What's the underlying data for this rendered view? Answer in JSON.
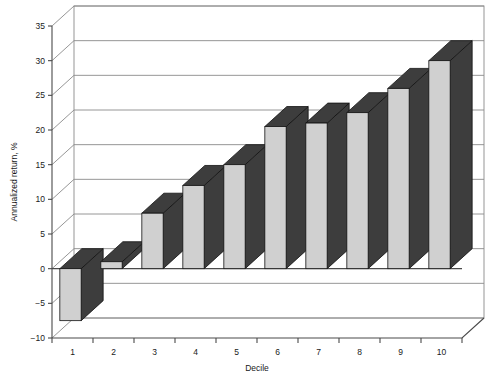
{
  "chart_data": {
    "type": "bar",
    "title": "",
    "subtitle": "",
    "xlabel": "Decile",
    "ylabel": "Annualized return, %",
    "categories": [
      "1",
      "2",
      "3",
      "4",
      "5",
      "6",
      "7",
      "8",
      "9",
      "10"
    ],
    "values": [
      -7.5,
      1.0,
      8.0,
      12.0,
      15.0,
      20.5,
      21.0,
      22.5,
      26.0,
      30.0
    ],
    "series": [
      {
        "name": "Annualized return",
        "values": [
          -7.5,
          1.0,
          8.0,
          12.0,
          15.0,
          20.5,
          21.0,
          22.5,
          26.0,
          30.0
        ]
      }
    ],
    "ylim": [
      -10,
      35
    ],
    "ytick_labels": [
      "35",
      "30",
      "25",
      "20",
      "15",
      "10",
      "5",
      "0",
      "-5",
      "-10"
    ],
    "ytick_values": [
      35,
      30,
      25,
      20,
      15,
      10,
      5,
      0,
      -5,
      -10
    ],
    "xtick_labels": [
      "1",
      "2",
      "3",
      "4",
      "5",
      "6",
      "7",
      "8",
      "9",
      "10"
    ],
    "grid": true,
    "legend": "none",
    "style": "3d-column",
    "colors": {
      "bar_front": "#d0d0d0",
      "bar_side": "#3d3d3d",
      "bar_top": "#3d3d3d",
      "bar_outline": "#111111",
      "axis": "#4a4a4a",
      "gridline": "#8a8a8a",
      "text": "#1a1a1a",
      "background": "#ffffff"
    }
  },
  "axes": {
    "y": {
      "title": "Annualized return, %",
      "ticks": [
        {
          "label": "35",
          "value": 35
        },
        {
          "label": "30",
          "value": 30
        },
        {
          "label": "25",
          "value": 25
        },
        {
          "label": "20",
          "value": 20
        },
        {
          "label": "15",
          "value": 15
        },
        {
          "label": "10",
          "value": 10
        },
        {
          "label": "5",
          "value": 5
        },
        {
          "label": "0",
          "value": 0
        },
        {
          "label": "-5",
          "value": -5
        },
        {
          "label": "-10",
          "value": -10
        }
      ]
    },
    "x": {
      "title": "Decile",
      "ticks": [
        {
          "label": "1"
        },
        {
          "label": "2"
        },
        {
          "label": "3"
        },
        {
          "label": "4"
        },
        {
          "label": "5"
        },
        {
          "label": "6"
        },
        {
          "label": "7"
        },
        {
          "label": "8"
        },
        {
          "label": "9"
        },
        {
          "label": "10"
        }
      ]
    }
  }
}
